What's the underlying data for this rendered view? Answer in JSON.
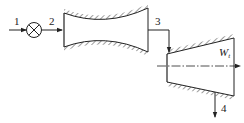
{
  "diagram": {
    "labels": {
      "state_1": "1",
      "state_2": "2",
      "state_3": "3",
      "state_4": "4",
      "work": "W",
      "work_sub": "t"
    },
    "components": [
      {
        "id": "valve",
        "type": "throttle-valve"
      },
      {
        "id": "nozzle",
        "type": "convergent-divergent-nozzle"
      },
      {
        "id": "turbine",
        "type": "turbine"
      }
    ],
    "colors": {
      "line": "#222222",
      "background": "#ffffff"
    }
  }
}
